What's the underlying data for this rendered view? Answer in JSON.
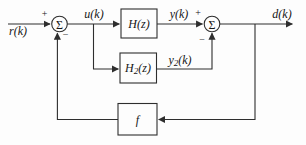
{
  "diagram": {
    "signals": {
      "input": "r(k)",
      "control": "u(k)",
      "plant_output": "y(k)",
      "model_output": {
        "pre": "y",
        "sub": "2",
        "post": "(k)"
      },
      "output": "d(k)"
    },
    "blocks": {
      "plant": "H(z)",
      "model": {
        "pre": "H",
        "sub": "2",
        "post": "(z)"
      },
      "feedback": "f"
    },
    "junctions": {
      "sigma": "Σ",
      "plus": "+",
      "minus": "−"
    },
    "colors": {
      "line": "#2e2e2e",
      "text": "#161616",
      "background": "#fdfdfd"
    }
  }
}
